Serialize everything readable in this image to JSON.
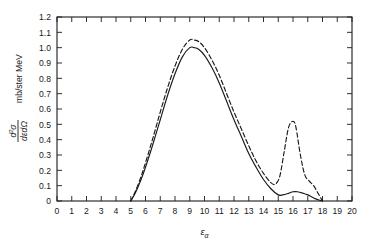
{
  "chart_data": {
    "type": "line",
    "title": "",
    "xlabel": "εα",
    "ylabel": "d²σ / dεdΩ   mb/ster MeV",
    "ylabel_numerator": "d²σ",
    "ylabel_denominator": "dεdΩ",
    "ylabel_units": "mb/ster MeV",
    "xlabel_base": "ε",
    "xlabel_sub": "α",
    "xlim": [
      0,
      20
    ],
    "ylim": [
      0,
      1.2
    ],
    "xticks": [
      0,
      1,
      2,
      3,
      4,
      5,
      6,
      7,
      8,
      9,
      10,
      11,
      12,
      13,
      14,
      15,
      16,
      17,
      18,
      19,
      20
    ],
    "xticklabels": [
      "0",
      "1",
      "2",
      "3",
      "4",
      "5",
      "6",
      "7",
      "8",
      "9",
      "10",
      "11",
      "12",
      "13",
      "14",
      "15",
      "16",
      "17",
      "18",
      "19",
      "20"
    ],
    "yticks": [
      0,
      0.1,
      0.2,
      0.3,
      0.4,
      0.5,
      0.6,
      0.7,
      0.8,
      0.9,
      1.0,
      1.1,
      1.2
    ],
    "yticklabels": [
      "0",
      "0.1",
      "0.2",
      "0.3",
      "0.4",
      "0.5",
      "0.6",
      "0.7",
      "0.8",
      "0.9",
      "1.0",
      "1.1",
      "1.2"
    ],
    "grid": false,
    "legend": "none",
    "frame": "box",
    "ticks_all_sides": true,
    "line_color": "#1a1a1a",
    "series": [
      {
        "name": "solid-curve",
        "style": "solid",
        "x": [
          5.0,
          5.3,
          5.7,
          6.0,
          6.5,
          7.0,
          7.5,
          8.0,
          8.5,
          9.0,
          9.3,
          9.6,
          10.0,
          10.5,
          11.0,
          11.5,
          12.0,
          12.5,
          13.0,
          13.5,
          14.0,
          14.5,
          15.0,
          15.3,
          15.7,
          16.0,
          16.3,
          16.7,
          17.0,
          17.4,
          17.8,
          18.0
        ],
        "y": [
          0.0,
          0.05,
          0.14,
          0.22,
          0.37,
          0.53,
          0.69,
          0.83,
          0.94,
          1.0,
          1.0,
          0.99,
          0.95,
          0.87,
          0.77,
          0.65,
          0.53,
          0.42,
          0.31,
          0.22,
          0.14,
          0.08,
          0.04,
          0.04,
          0.05,
          0.06,
          0.06,
          0.05,
          0.04,
          0.02,
          0.005,
          0.0
        ]
      },
      {
        "name": "dashed-curve",
        "style": "dashed",
        "x": [
          5.0,
          5.3,
          5.7,
          6.0,
          6.5,
          7.0,
          7.5,
          8.0,
          8.5,
          9.0,
          9.3,
          9.6,
          10.0,
          10.5,
          11.0,
          11.5,
          12.0,
          12.5,
          13.0,
          13.5,
          14.0,
          14.5,
          14.8,
          15.1,
          15.4,
          15.7,
          16.0,
          16.2,
          16.5,
          16.8,
          17.1,
          17.4,
          17.7,
          18.0
        ],
        "y": [
          0.0,
          0.06,
          0.16,
          0.25,
          0.41,
          0.58,
          0.74,
          0.88,
          0.99,
          1.05,
          1.05,
          1.04,
          1.0,
          0.92,
          0.82,
          0.7,
          0.58,
          0.47,
          0.36,
          0.26,
          0.18,
          0.12,
          0.11,
          0.16,
          0.32,
          0.48,
          0.52,
          0.48,
          0.3,
          0.17,
          0.13,
          0.1,
          0.05,
          0.0
        ]
      }
    ],
    "annotations": {
      "main_peak_x": 9.3,
      "main_peak_solid_y": 1.0,
      "main_peak_dashed_y": 1.05,
      "secondary_peak_x": 16.0,
      "secondary_peak_dashed_y": 0.52,
      "secondary_peak_solid_y": 0.06,
      "curve_start_x": 5.0,
      "curve_end_x": 18.0
    }
  }
}
